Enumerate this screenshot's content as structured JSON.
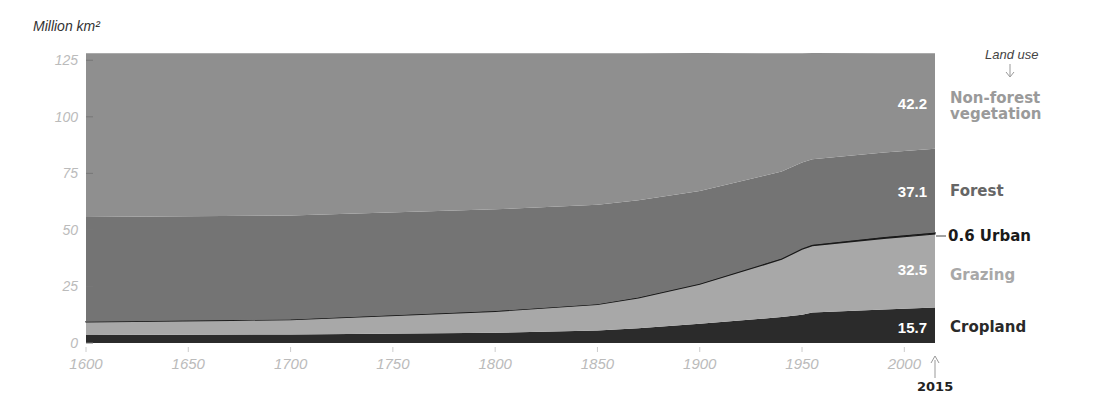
{
  "chart_data": {
    "type": "area",
    "stacked": true,
    "title": "",
    "ylabel": "Million km²",
    "xlabel": "",
    "xlim": [
      1600,
      2015
    ],
    "ylim": [
      0,
      128
    ],
    "x_ticks": [
      "1600",
      "1650",
      "1700",
      "1750",
      "1800",
      "1850",
      "1900",
      "1950",
      "2000"
    ],
    "y_ticks": [
      "0",
      "25",
      "50",
      "75",
      "100",
      "125"
    ],
    "x": [
      1600,
      1700,
      1800,
      1850,
      1870,
      1900,
      1940,
      1950,
      1955,
      1990,
      2015
    ],
    "series": [
      {
        "name": "Cropland",
        "color": "#2b2b2b",
        "values": [
          3.5,
          3.8,
          4.5,
          5.5,
          6.5,
          8.5,
          11.5,
          12.5,
          13.5,
          14.8,
          15.7
        ]
      },
      {
        "name": "Grazing",
        "color": "#a8a8a8",
        "values": [
          5.8,
          6.5,
          9.5,
          11.5,
          13.5,
          17.5,
          25.5,
          29.0,
          29.5,
          31.5,
          32.5
        ]
      },
      {
        "name": "Urban",
        "color": "#1a1a1a",
        "values": [
          0.1,
          0.1,
          0.1,
          0.1,
          0.1,
          0.2,
          0.3,
          0.3,
          0.4,
          0.5,
          0.6
        ]
      },
      {
        "name": "Forest",
        "color": "#747474",
        "values": [
          46.3,
          46.0,
          45.0,
          44.0,
          43.0,
          41.0,
          38.5,
          38.0,
          37.8,
          37.4,
          37.1
        ]
      },
      {
        "name": "Non-forest vegetation",
        "color": "#8f8f8f",
        "values": [
          72.4,
          71.7,
          69.0,
          67.0,
          65.0,
          61.0,
          52.3,
          48.3,
          47.0,
          43.9,
          42.2
        ]
      }
    ],
    "end_labels": {
      "Non-forest vegetation": "42.2",
      "Forest": "37.1",
      "Urban": "0.6",
      "Grazing": "32.5",
      "Cropland": "15.7"
    },
    "legend_position": "right"
  },
  "header": {
    "unit": "Million km²",
    "legend_title": "Land use",
    "end_year": "2015"
  },
  "labels": {
    "nonforest_line1": "Non-forest",
    "nonforest_line2": "vegetation",
    "nonforest_value": "42.2",
    "forest": "Forest",
    "forest_value": "37.1",
    "urban": "Urban",
    "urban_value": "0.6",
    "grazing": "Grazing",
    "grazing_value": "32.5",
    "cropland": "Cropland",
    "cropland_value": "15.7"
  },
  "colors": {
    "nonforest_label": "#9a9a9a",
    "forest_label": "#666666",
    "urban_label": "#1a1a1a",
    "grazing_label": "#a8a8a8",
    "cropland_label": "#2a2a2a"
  }
}
